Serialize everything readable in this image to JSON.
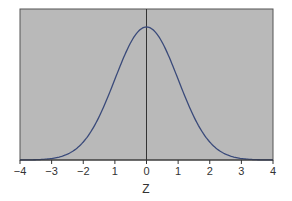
{
  "chart_data": {
    "type": "line",
    "title": "",
    "xlabel": "Z",
    "ylabel": "",
    "xlim": [
      -4,
      4
    ],
    "ylim": [
      0,
      0.4
    ],
    "grid": false,
    "legend": null,
    "x_ticks": [
      "−4",
      "−3",
      "−2",
      "1",
      "0",
      "1",
      "2",
      "3",
      "4"
    ],
    "x_tick_values": [
      -4,
      -3,
      -2,
      -1,
      0,
      1,
      2,
      3,
      4
    ],
    "series": [
      {
        "name": "Standard normal density",
        "x": [
          -4,
          -3.5,
          -3,
          -2.5,
          -2,
          -1.5,
          -1,
          -0.5,
          0,
          0.5,
          1,
          1.5,
          2,
          2.5,
          3,
          3.5,
          4
        ],
        "values": [
          0.0001,
          0.0009,
          0.0044,
          0.0175,
          0.054,
          0.1295,
          0.242,
          0.3521,
          0.3989,
          0.3521,
          0.242,
          0.1295,
          0.054,
          0.0175,
          0.0044,
          0.0009,
          0.0001
        ],
        "color": "#3a4a7a"
      }
    ],
    "annotations": [
      "vertical line at z = 0"
    ],
    "colors": {
      "plot_background": "#b8b8b8",
      "curve": "#3a4a7a",
      "frame": "#444444"
    }
  }
}
